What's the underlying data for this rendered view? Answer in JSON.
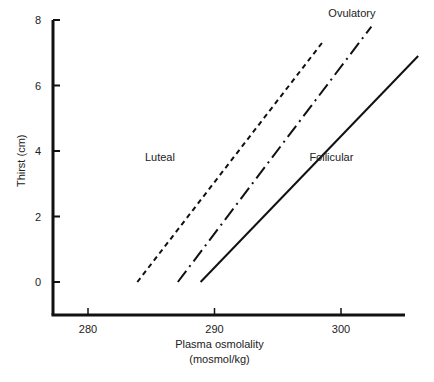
{
  "chart_data": {
    "type": "line",
    "title": "",
    "xlabel": "Plasma osmolality",
    "xlabel_units": "(mosmol/kg)",
    "ylabel": "Thirst (cm)",
    "xlim": [
      275,
      306
    ],
    "ylim": [
      -1,
      8
    ],
    "x_ticks": [
      280,
      290,
      300
    ],
    "y_ticks": [
      0,
      2,
      4,
      6,
      8
    ],
    "grid": false,
    "legend": "inline labels",
    "series": [
      {
        "name": "Luteal",
        "style": "dashed",
        "x": [
          283.9,
          298.5
        ],
        "y": [
          0,
          7.3
        ],
        "label_pos": {
          "x": 284.5,
          "y": 3.7
        }
      },
      {
        "name": "Ovulatory",
        "style": "dash-dot",
        "x": [
          287.1,
          302.4
        ],
        "y": [
          0,
          7.8
        ],
        "label_pos": {
          "x": 299.0,
          "y": 8.1
        }
      },
      {
        "name": "Follicular",
        "style": "solid",
        "x": [
          288.9,
          306.1
        ],
        "y": [
          0,
          6.9
        ],
        "label_pos": {
          "x": 297.5,
          "y": 3.7
        }
      }
    ]
  }
}
